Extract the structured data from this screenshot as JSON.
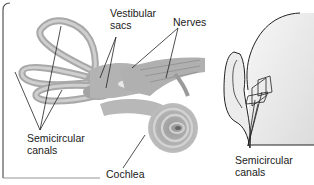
{
  "diagram": {
    "left_panel": {
      "labels": {
        "vestibular_sacs": "Vestibular\nsacs",
        "nerves": "Nerves",
        "semicircular_canals": "Semicircular\ncanals",
        "cochlea": "Cochlea"
      }
    },
    "right_panel": {
      "labels": {
        "semicircular_canals": "Semicircular\ncanals"
      }
    },
    "colors": {
      "organ_fill": "#b8b8b8",
      "organ_dark": "#8f8f8f",
      "organ_light": "#d6d6d6",
      "outline": "#2a2a2a",
      "frame": "#555555",
      "head_shade": "#e6e6e6"
    }
  }
}
